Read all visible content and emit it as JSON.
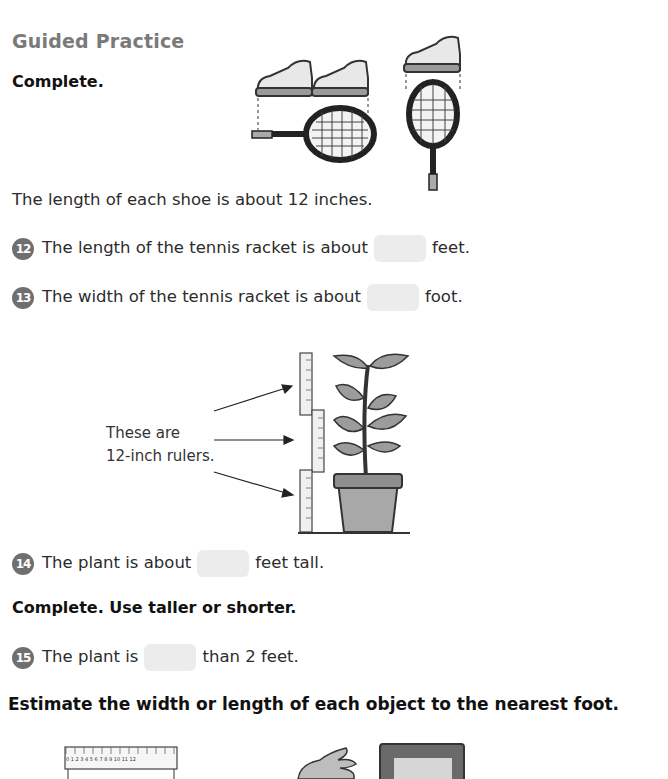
{
  "page": {
    "title": "Guided Practice",
    "section1": {
      "instruction": "Complete.",
      "given": "The length of each shoe is about 12 inches.",
      "questions": [
        {
          "number": "12",
          "before": "The length of the tennis racket is about",
          "after": "feet.",
          "answer": ""
        },
        {
          "number": "13",
          "before": "The width of the tennis racket is about",
          "after": "foot.",
          "answer": ""
        }
      ]
    },
    "plant_figure": {
      "caption_line1": "These are",
      "caption_line2": "12-inch rulers."
    },
    "q14": {
      "number": "14",
      "before": "The plant is about",
      "after": "feet tall.",
      "answer": ""
    },
    "section2": {
      "instruction": "Complete. Use taller or shorter.",
      "q15": {
        "number": "15",
        "before": "The plant is",
        "after": "than 2 feet.",
        "answer": ""
      }
    },
    "section3": {
      "instruction": "Estimate the width or length of each object to the nearest foot.",
      "ruler_ticks": [
        "0",
        "1",
        "2",
        "3",
        "4",
        "5",
        "6",
        "7",
        "8",
        "9",
        "10",
        "11",
        "12"
      ],
      "ruler_unit": "inches"
    },
    "colors": {
      "title_gray": "#7a7a7a",
      "badge_gray": "#6f6f6f",
      "blank_fill": "#ececec"
    }
  }
}
